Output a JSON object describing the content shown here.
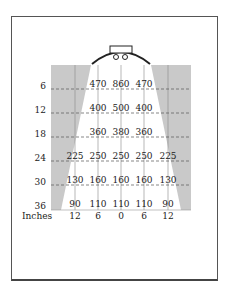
{
  "diagram": {
    "row_labels": [
      "6",
      "12",
      "18",
      "24",
      "30",
      "36"
    ],
    "x_axis_unit": "Inches",
    "x_axis_labels": [
      "12",
      "6",
      "0",
      "6",
      "12"
    ],
    "rows": [
      {
        "distance": "6",
        "values": [
          "",
          "470",
          "860",
          "470",
          ""
        ]
      },
      {
        "distance": "12",
        "values": [
          "",
          "400",
          "500",
          "400",
          ""
        ]
      },
      {
        "distance": "18",
        "values": [
          "",
          "360",
          "380",
          "360",
          ""
        ]
      },
      {
        "distance": "24",
        "values": [
          "225",
          "250",
          "250",
          "250",
          "225"
        ]
      },
      {
        "distance": "30",
        "values": [
          "130",
          "160",
          "160",
          "160",
          "130"
        ]
      },
      {
        "distance": "36",
        "values": [
          "90",
          "110",
          "110",
          "110",
          "90"
        ]
      }
    ],
    "colors": {
      "shade": "#c8c8c8",
      "grid_line": "#666666",
      "frame": "#555555",
      "lamp": "#222222"
    }
  }
}
